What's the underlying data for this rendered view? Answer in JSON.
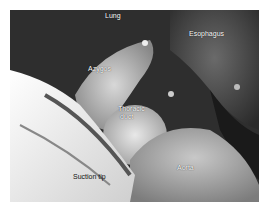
{
  "figure": {
    "type": "grayscale intraoperative photograph",
    "labels": {
      "lung": "Lung",
      "esophagus": "Esophagus",
      "azygos": "Azygos",
      "thoracic_duct_line1": "Thoracic",
      "thoracic_duct_line2": "duct",
      "aorta": "Aorta",
      "suction_tip": "Suction tip"
    }
  }
}
